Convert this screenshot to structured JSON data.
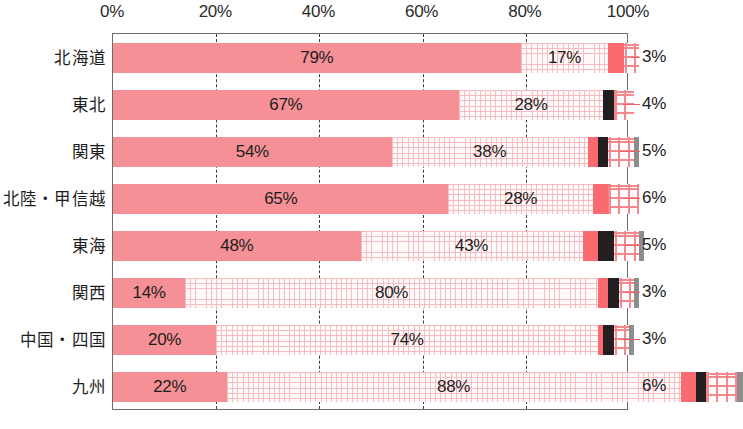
{
  "chart_data": {
    "type": "bar",
    "orientation": "horizontal",
    "title": "",
    "xlabel": "",
    "ylabel": "",
    "xlim": [
      0,
      100
    ],
    "grid": true,
    "gridlines_style": "dashed vertical",
    "legend": "none",
    "xticks": [
      "0%",
      "20%",
      "40%",
      "60%",
      "80%",
      "100%"
    ],
    "xtick_values": [
      0,
      20,
      40,
      60,
      80,
      100
    ],
    "categories": [
      "北海道",
      "東北",
      "関東",
      "北陸・甲信越",
      "東海",
      "関西",
      "中国・四国",
      "九州"
    ],
    "series": [
      {
        "name": "segment-1",
        "style": "solid-pink",
        "color": "#f59097",
        "values": [
          79,
          67,
          54,
          65,
          48,
          14,
          20,
          22
        ]
      },
      {
        "name": "segment-2",
        "style": "pink-grid-hatch",
        "color": "#f8bcc0",
        "values": [
          17,
          28,
          38,
          28,
          43,
          80,
          74,
          88
        ]
      },
      {
        "name": "segment-3",
        "style": "solid-coral",
        "color": "#fb6a6e",
        "values": [
          3,
          0,
          2,
          3,
          3,
          2,
          1,
          3
        ]
      },
      {
        "name": "segment-4",
        "style": "solid-black",
        "color": "#231f20",
        "values": [
          0,
          2,
          2,
          0,
          3,
          2,
          2,
          2
        ]
      },
      {
        "name": "segment-5",
        "style": "pink-dotted",
        "color": "#f4888d",
        "values": [
          3,
          4,
          5,
          6,
          5,
          3,
          3,
          6
        ]
      },
      {
        "name": "segment-6",
        "style": "solid-gray",
        "color": "#8d8d8d",
        "values": [
          0,
          0,
          1,
          0,
          1,
          1,
          1,
          1
        ]
      }
    ],
    "bars": [
      {
        "category": "北海道",
        "inside_labels": [
          {
            "text": "79%",
            "series": "segment-1"
          },
          {
            "text": "17%",
            "series": "segment-2"
          }
        ],
        "callout_label": "3%",
        "callout_series": "segment-5"
      },
      {
        "category": "東北",
        "inside_labels": [
          {
            "text": "67%",
            "series": "segment-1"
          },
          {
            "text": "28%",
            "series": "segment-2"
          }
        ],
        "callout_label": "4%",
        "callout_series": "segment-5"
      },
      {
        "category": "関東",
        "inside_labels": [
          {
            "text": "54%",
            "series": "segment-1"
          },
          {
            "text": "38%",
            "series": "segment-2"
          }
        ],
        "callout_label": "5%",
        "callout_series": "segment-5"
      },
      {
        "category": "北陸・甲信越",
        "inside_labels": [
          {
            "text": "65%",
            "series": "segment-1"
          },
          {
            "text": "28%",
            "series": "segment-2"
          }
        ],
        "callout_label": "6%",
        "callout_series": "segment-5"
      },
      {
        "category": "東海",
        "inside_labels": [
          {
            "text": "48%",
            "series": "segment-1"
          },
          {
            "text": "43%",
            "series": "segment-2"
          }
        ],
        "callout_label": "5%",
        "callout_series": "segment-5"
      },
      {
        "category": "関西",
        "inside_labels": [
          {
            "text": "14%",
            "series": "segment-1"
          },
          {
            "text": "80%",
            "series": "segment-2"
          }
        ],
        "callout_label": "3%",
        "callout_series": "segment-5"
      },
      {
        "category": "中国・四国",
        "inside_labels": [
          {
            "text": "20%",
            "series": "segment-1"
          },
          {
            "text": "74%",
            "series": "segment-2"
          }
        ],
        "callout_label": "3%",
        "callout_series": "segment-5"
      },
      {
        "category": "九州",
        "inside_labels": [
          {
            "text": "22%",
            "series": "segment-1"
          },
          {
            "text": "88%",
            "series": "segment-2"
          }
        ],
        "callout_label": "6%",
        "callout_series": "segment-5"
      }
    ]
  },
  "colors": {
    "segment_1": "#f59097",
    "segment_2": "#f8bcc0",
    "segment_3": "#fb6a6e",
    "segment_4": "#231f20",
    "segment_5": "#f4888d",
    "segment_6": "#8d8d8d",
    "frame": "#6d6d6d",
    "gridline": "#3a3a3a",
    "leader_line": "#ef5f63",
    "text": "#1d1d1d"
  },
  "layout": {
    "plot_left_px": 112,
    "plot_top_px": 33,
    "plot_width_px": 516,
    "plot_height_px": 377,
    "bar_height_px": 30
  }
}
